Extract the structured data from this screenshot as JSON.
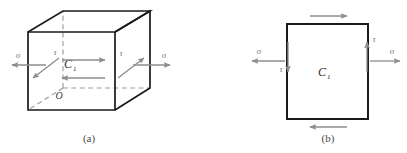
{
  "figure": {
    "panels": [
      {
        "id": "a",
        "caption": "(a)",
        "kind": "cube-3d",
        "origin_label": "O",
        "center_label": "C",
        "center_subscript": "1",
        "stresses": [
          {
            "name": "sigma-left",
            "symbol": "σ",
            "direction": "left",
            "side": "left"
          },
          {
            "name": "tau-left",
            "symbol": "τ",
            "direction": "down-left",
            "side": "left"
          },
          {
            "name": "sigma-right",
            "symbol": "σ",
            "direction": "right",
            "side": "right"
          },
          {
            "name": "tau-right",
            "symbol": "τ",
            "direction": "up-right",
            "side": "right"
          },
          {
            "name": "shear-top",
            "symbol": "",
            "direction": "right",
            "side": "interior-top"
          },
          {
            "name": "shear-bottom",
            "symbol": "",
            "direction": "left",
            "side": "interior-bottom"
          }
        ]
      },
      {
        "id": "b",
        "caption": "(b)",
        "kind": "square-2d",
        "center_label": "C",
        "center_subscript": "1",
        "stresses": [
          {
            "name": "sigma-left",
            "symbol": "σ",
            "direction": "left",
            "side": "left"
          },
          {
            "name": "tau-left",
            "symbol": "τ",
            "direction": "down",
            "side": "left-edge"
          },
          {
            "name": "sigma-right",
            "symbol": "σ",
            "direction": "right",
            "side": "right"
          },
          {
            "name": "tau-right",
            "symbol": "τ",
            "direction": "up",
            "side": "right-edge"
          },
          {
            "name": "shear-top",
            "symbol": "",
            "direction": "right",
            "side": "top"
          },
          {
            "name": "shear-bottom",
            "symbol": "",
            "direction": "left",
            "side": "bottom"
          }
        ]
      }
    ],
    "colors": {
      "solid_edge": "#1a1a1a",
      "hidden_edge": "#9a9a9a",
      "arrow": "#8c8c8c",
      "symbol": "#7d7d7d",
      "caption": "#4a4a4a",
      "background": "#ffffff"
    }
  }
}
